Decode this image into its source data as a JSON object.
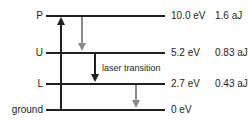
{
  "diagram": {
    "type": "laser-energy-level-diagram",
    "levels": [
      {
        "label": "P",
        "energy": "10.0 eV",
        "energy_alt": "1.6 aJ"
      },
      {
        "label": "U",
        "energy": "5.2 eV",
        "energy_alt": "0.83 aJ"
      },
      {
        "label": "L",
        "energy": "2.7 eV",
        "energy_alt": "0.43 aJ"
      },
      {
        "label": "ground",
        "energy": "0 eV",
        "energy_alt": ""
      }
    ],
    "transitions": [
      {
        "name": "pump",
        "from": "ground",
        "to": "P",
        "direction": "up",
        "color": "#231f20",
        "label": ""
      },
      {
        "name": "decay-P-to-U",
        "from": "P",
        "to": "U",
        "direction": "down",
        "color": "#8b8b8b",
        "label": ""
      },
      {
        "name": "laser-transition",
        "from": "U",
        "to": "L",
        "direction": "down",
        "color": "#231f20",
        "label": "laser transition"
      },
      {
        "name": "decay-L-to-ground",
        "from": "L",
        "to": "ground",
        "direction": "down",
        "color": "#8b8b8b",
        "label": ""
      }
    ],
    "colors": {
      "line": "#231f20",
      "text": "#231f20",
      "gray_arrow": "#8b8b8b",
      "background": "#ffffff"
    }
  }
}
